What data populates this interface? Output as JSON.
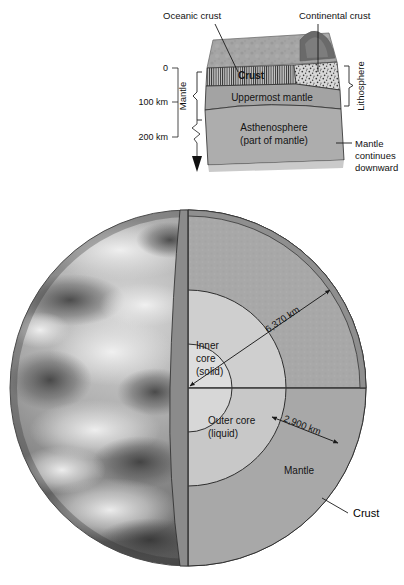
{
  "figure": {
    "background_color": "#ffffff"
  },
  "inset": {
    "name": "lithosphere-asthenosphere-block",
    "callouts": {
      "oceanic_crust": "Oceanic crust",
      "continental_crust": "Continental crust",
      "mantle_continues": "Mantle\ncontinues\ndownward",
      "mantle_continues_line1": "Mantle",
      "mantle_continues_line2": "continues",
      "mantle_continues_line3": "downward"
    },
    "layers": [
      {
        "id": "crust",
        "label": "Crust",
        "color": "#a9a9a9"
      },
      {
        "id": "uppermost-mantle",
        "label": "Uppermost mantle",
        "color": "#a3a3a3"
      },
      {
        "id": "asthenosphere",
        "label_line1": "Asthenosphere",
        "label_line2": "(part of mantle)",
        "color": "#adadad"
      }
    ],
    "brackets": {
      "mantle": "Mantle",
      "lithosphere": "Lithosphere"
    },
    "depth_scale": {
      "ticks": [
        {
          "value": "0"
        },
        {
          "value": "100 km"
        },
        {
          "value": "200 km"
        }
      ]
    }
  },
  "earth": {
    "name": "earth-cutaway",
    "layers": [
      {
        "id": "crust",
        "label": "Crust",
        "color": "#9a9a9a"
      },
      {
        "id": "mantle",
        "label": "Mantle",
        "color": "#a8a8a8"
      },
      {
        "id": "outer-core",
        "label_line1": "Outer core",
        "label_line2": "(liquid)",
        "color": "#cfcfcf"
      },
      {
        "id": "inner-core",
        "label_line1": "Inner",
        "label_line2": "core",
        "label_line3": "(solid)",
        "color": "#dcdcdc"
      }
    ],
    "measurements": [
      {
        "id": "earth-radius",
        "value": "6,370 km"
      },
      {
        "id": "core-mantle-boundary-depth",
        "value": "2,900 km"
      }
    ]
  },
  "colors": {
    "mantle_face": "#a8a8a8",
    "mantle_cut_dark": "#8b8b8b",
    "outer_core": "#cfcfcf",
    "inner_core": "#dedede",
    "crust_band": "#939393",
    "line": "#1f1f1f"
  }
}
